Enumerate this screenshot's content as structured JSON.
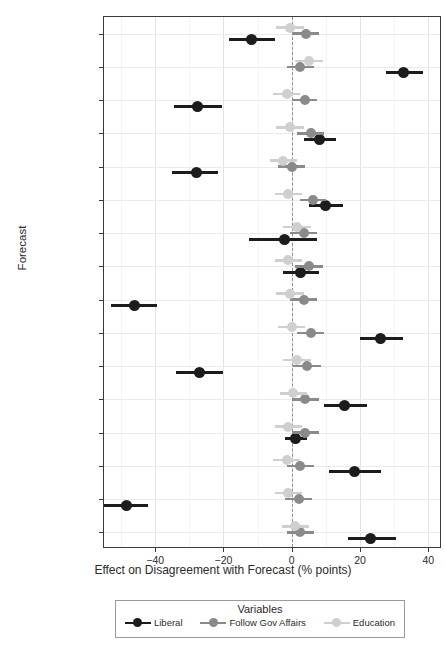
{
  "chart_data": {
    "type": "scatter",
    "title": "",
    "xlabel": "Effect on Disagreement with Forecast (% points)",
    "ylabel": "Forecast",
    "xlim": [
      -55,
      44
    ],
    "xticks": [
      -40,
      -20,
      0,
      20,
      40
    ],
    "xticklabels": [
      "−40",
      "−20",
      "0",
      "20",
      "40"
    ],
    "grid": true,
    "zero_reference_line": 0,
    "legend_title": "Variables",
    "legend_position": "bottom",
    "categories": [
      "War & Peace 2",
      "War & Peace 1",
      "Terrorism 2",
      "Terrorism 1",
      "National Debt 2",
      "National Debt 1",
      "Military 2",
      "Military 1",
      "Immigration 2",
      "Immigration 1",
      "Foreign Policy 2",
      "Foreign Policy 1",
      "Economy 2",
      "Economy 1",
      "Climate 2",
      "Climate 1"
    ],
    "series": [
      {
        "name": "Liberal",
        "color": "#1c1c1c",
        "values": [
          -11.7,
          32.8,
          -27.5,
          8.2,
          -28.0,
          9.8,
          -2.0,
          2.5,
          -46.0,
          26.0,
          -27.0,
          15.5,
          1.2,
          18.5,
          -48.4,
          23.0
        ],
        "ci_lower": [
          -18.5,
          27.5,
          -34.5,
          3.5,
          -35.0,
          5.0,
          -12.5,
          -2.5,
          -53.0,
          20.0,
          -34.0,
          9.5,
          -2.0,
          11.0,
          -55.0,
          16.5
        ],
        "ci_upper": [
          -5.0,
          38.5,
          -20.5,
          13.0,
          -21.5,
          15.0,
          7.5,
          8.0,
          -39.5,
          32.5,
          -20.0,
          22.0,
          4.5,
          26.0,
          -42.0,
          30.5
        ]
      },
      {
        "name": "Follow Gov Affairs",
        "color": "#8a8a8a",
        "values": [
          4.3,
          2.5,
          3.8,
          5.5,
          0.0,
          6.2,
          3.5,
          5.0,
          3.5,
          5.5,
          4.5,
          4.0,
          4.0,
          2.5,
          2.0,
          2.5
        ],
        "ci_lower": [
          0.5,
          -1.5,
          0.0,
          1.5,
          -4.0,
          2.5,
          -0.5,
          1.0,
          -0.5,
          1.5,
          0.5,
          0.0,
          0.0,
          -1.5,
          -2.0,
          -1.5
        ],
        "ci_upper": [
          8.0,
          6.5,
          7.5,
          9.5,
          4.0,
          10.0,
          7.5,
          9.0,
          7.5,
          9.5,
          8.5,
          8.0,
          8.0,
          6.5,
          6.0,
          6.5
        ]
      },
      {
        "name": "Education",
        "color": "#cfcfcf",
        "values": [
          -0.5,
          5.0,
          -1.5,
          -0.5,
          -2.5,
          -1.0,
          1.5,
          -1.0,
          -0.5,
          0.0,
          1.5,
          0.5,
          -1.0,
          -1.5,
          -1.0,
          1.0
        ],
        "ci_lower": [
          -4.5,
          1.0,
          -5.5,
          -4.5,
          -6.5,
          -5.0,
          -2.5,
          -5.0,
          -4.5,
          -4.0,
          -2.5,
          -3.5,
          -5.0,
          -5.5,
          -5.0,
          -3.0
        ],
        "ci_upper": [
          3.5,
          9.0,
          2.5,
          3.5,
          1.5,
          3.0,
          5.5,
          3.0,
          3.5,
          4.0,
          5.5,
          4.5,
          3.0,
          2.5,
          3.0,
          5.0
        ]
      }
    ]
  },
  "axis": {
    "y_title": "Forecast",
    "x_title": "Effect on Disagreement with Forecast (% points)"
  },
  "legend": {
    "title": "Variables",
    "items": [
      {
        "label": "Liberal",
        "color": "#1c1c1c"
      },
      {
        "label": "Follow Gov Affairs",
        "color": "#8a8a8a"
      },
      {
        "label": "Education",
        "color": "#cfcfcf"
      }
    ]
  }
}
